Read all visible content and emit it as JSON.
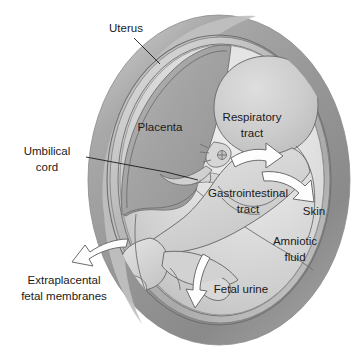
{
  "figure": {
    "background_color": "#ffffff",
    "width": 357,
    "height": 357
  },
  "palette": {
    "uterus_wall": "#9a9a9a",
    "uterus_wall_dark": "#7d7d7d",
    "uterus_wall_light": "#c3c3c3",
    "membrane_ring": "#b5b5b5",
    "placenta": "#a5a5a5",
    "placenta_dark": "#8d8d8d",
    "amniotic_fluid": "#d4d4d4",
    "amniotic_fluid_light": "#ededed",
    "fetus_body": "#d9d9d9",
    "fetus_head": "#c9c9c9",
    "outline_stroke": "#6e6e6e",
    "label_text": "#1a1a1a",
    "arrow_fill": "#fdfdfd",
    "arrow_stroke": "#6b6b6b",
    "leader_line": "#1a1a1a"
  },
  "labels": [
    {
      "id": "uterus",
      "text": "Uterus",
      "lines": [
        "Uterus"
      ],
      "x": 126,
      "y": 30,
      "has_leader": true
    },
    {
      "id": "placenta",
      "text": "Placenta",
      "lines": [
        "Placenta"
      ],
      "x": 160,
      "y": 128,
      "has_leader": false
    },
    {
      "id": "respiratory-tract",
      "text": "Respiratory tract",
      "lines": [
        "Respiratory",
        "tract"
      ],
      "x": 252,
      "y": 124,
      "has_leader": false
    },
    {
      "id": "umbilical-cord",
      "text": "Umbilical cord",
      "lines": [
        "Umbilical",
        "cord"
      ],
      "x": 47,
      "y": 160,
      "has_leader": true
    },
    {
      "id": "gastrointestinal-tract",
      "text": "Gastrointestinal tract",
      "lines": [
        "Gastrointestinal",
        "tract"
      ],
      "x": 248,
      "y": 200,
      "has_leader": false
    },
    {
      "id": "skin",
      "text": "Skin",
      "lines": [
        "Skin"
      ],
      "x": 314,
      "y": 212,
      "has_leader": false
    },
    {
      "id": "amniotic-fluid",
      "text": "Amniotic fluid",
      "lines": [
        "Amniotic",
        "fluid"
      ],
      "x": 293,
      "y": 248,
      "has_leader": false
    },
    {
      "id": "fetal-urine",
      "text": "Fetal urine",
      "lines": [
        "Fetal urine"
      ],
      "x": 241,
      "y": 290,
      "has_leader": false
    },
    {
      "id": "extraplacental-fetal-membranes",
      "text": "Extraplacental fetal membranes",
      "lines": [
        "Extraplacental",
        "fetal membranes"
      ],
      "x": 62,
      "y": 287,
      "has_leader": false
    }
  ],
  "label_text": {
    "uterus": "Uterus",
    "placenta": "Placenta",
    "respiratory_l1": "Respiratory",
    "respiratory_l2": "tract",
    "umbilical_l1": "Umbilical",
    "umbilical_l2": "cord",
    "gastrointestinal_l1": "Gastrointestinal",
    "gastrointestinal_l2": "tract",
    "skin": "Skin",
    "amniotic_l1": "Amniotic",
    "amniotic_l2": "fluid",
    "fetal_urine": "Fetal urine",
    "extraplacental_l1": "Extraplacental",
    "extraplacental_l2": "fetal membranes"
  },
  "arrows": [
    {
      "id": "respiratory-arrow",
      "points_to": "respiratory tract exchange",
      "direction": "right",
      "style": "curved-white"
    },
    {
      "id": "skin-arrow",
      "points_to": "skin",
      "direction": "right-down",
      "style": "curved-white"
    },
    {
      "id": "fetal-urine-arrow",
      "points_to": "fetal urine",
      "direction": "down-left",
      "style": "curved-white"
    },
    {
      "id": "extraplacental-arrow",
      "points_to": "extraplacental fetal membranes",
      "direction": "left-down",
      "style": "curved-white"
    }
  ],
  "structures": [
    {
      "id": "uterus-wall",
      "name": "uterus wall"
    },
    {
      "id": "membrane-ring",
      "name": "extraplacental fetal membranes ring"
    },
    {
      "id": "amniotic-cavity",
      "name": "amniotic cavity"
    },
    {
      "id": "placenta-mass",
      "name": "placenta"
    },
    {
      "id": "umbilical-cord-structure",
      "name": "umbilical cord"
    },
    {
      "id": "fetus",
      "name": "fetus"
    }
  ]
}
